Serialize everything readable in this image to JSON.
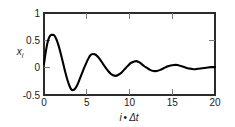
{
  "chart_data": {
    "type": "line",
    "title": "",
    "subtitle": "",
    "xlabel": "i • Δt",
    "xlabel_parts": {
      "symbol": "i",
      "operator": "•",
      "delta": "Δt"
    },
    "ylabel": "x_i",
    "ylabel_parts": {
      "base": "x",
      "subscript": "i"
    },
    "xlim": [
      0,
      20
    ],
    "ylim": [
      -0.5,
      1
    ],
    "xticks": [
      0,
      5,
      10,
      15,
      20
    ],
    "xtick_labels": [
      "0",
      "5",
      "10",
      "15",
      "20"
    ],
    "yticks": [
      -0.5,
      0,
      0.5,
      1
    ],
    "ytick_labels": [
      "-0.5",
      "0",
      "0.5",
      "1"
    ],
    "grid": false,
    "legend": null,
    "legend_position": "none",
    "series": [
      {
        "name": "x_i",
        "color": "#000000",
        "linewidth": 2.1,
        "description": "damped oscillation decaying toward zero",
        "x": [
          0.0,
          0.25,
          0.5,
          0.75,
          1.0,
          1.1,
          1.25,
          1.5,
          1.75,
          2.0,
          2.25,
          2.5,
          2.75,
          3.0,
          3.2,
          3.4,
          3.6,
          3.85,
          4.1,
          4.35,
          4.6,
          4.9,
          5.2,
          5.45,
          5.7,
          6.0,
          6.3,
          6.6,
          6.9,
          7.2,
          7.5,
          7.8,
          8.1,
          8.4,
          8.7,
          9.0,
          9.3,
          9.6,
          9.9,
          10.2,
          10.5,
          10.8,
          11.1,
          11.4,
          11.7,
          12.0,
          12.4,
          12.8,
          13.2,
          13.6,
          14.0,
          14.4,
          14.8,
          15.2,
          15.6,
          16.0,
          16.4,
          16.8,
          17.2,
          17.6,
          18.0,
          18.5,
          19.0,
          19.5,
          20.0
        ],
        "y": [
          0.07,
          0.33,
          0.51,
          0.59,
          0.6,
          0.6,
          0.58,
          0.5,
          0.38,
          0.23,
          0.07,
          -0.09,
          -0.23,
          -0.34,
          -0.4,
          -0.41,
          -0.39,
          -0.33,
          -0.24,
          -0.14,
          -0.04,
          0.07,
          0.17,
          0.23,
          0.25,
          0.24,
          0.2,
          0.14,
          0.07,
          0.0,
          -0.06,
          -0.11,
          -0.14,
          -0.15,
          -0.13,
          -0.1,
          -0.05,
          0.0,
          0.05,
          0.09,
          0.11,
          0.12,
          0.1,
          0.07,
          0.03,
          0.0,
          -0.04,
          -0.06,
          -0.06,
          -0.04,
          -0.01,
          0.02,
          0.04,
          0.05,
          0.05,
          0.03,
          0.01,
          -0.01,
          -0.02,
          -0.03,
          -0.02,
          -0.01,
          0.0,
          0.01,
          0.01
        ],
        "key_points": {
          "start_value": 0.07,
          "first_peak": {
            "x": 1.1,
            "y": 0.6
          },
          "first_trough": {
            "x": 3.4,
            "y": -0.41
          },
          "second_peak": {
            "x": 5.6,
            "y": 0.25
          },
          "second_trough": {
            "x": 8.3,
            "y": -0.15
          },
          "third_peak": {
            "x": 10.7,
            "y": 0.12
          },
          "end_value": 0.01,
          "approx_period": 4.4
        }
      }
    ]
  },
  "axes": {
    "frame_color": "#2b2b2b",
    "tick_color": "#7a7a7a",
    "background": "#ffffff"
  }
}
